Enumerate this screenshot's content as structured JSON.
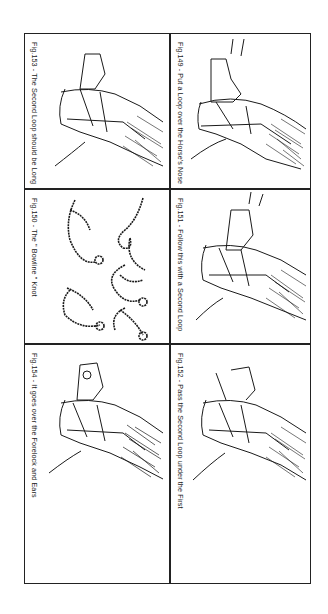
{
  "page": {
    "orientation": "rotated-90-clockwise",
    "layout": {
      "columns": 2,
      "rows": 3
    }
  },
  "panels": [
    {
      "id": "fig149",
      "column": "right",
      "row": 1,
      "caption": "Fig.149 - Put a Loop over the Horse's Nose",
      "illustration": "horse-head-loop-over-nose"
    },
    {
      "id": "fig151",
      "column": "right",
      "row": 2,
      "caption": "Fig.151 - Follow this with a Second Loop",
      "illustration": "horse-head-second-loop"
    },
    {
      "id": "fig152",
      "column": "right",
      "row": 3,
      "caption": "Fig.152 - Pass the Second Loop under the First",
      "illustration": "horse-head-pass-loop-under"
    },
    {
      "id": "fig153",
      "column": "left",
      "row": 1,
      "caption": "Fig.153 - The Second Loop should be Long",
      "illustration": "horse-head-long-loop"
    },
    {
      "id": "fig150",
      "column": "left",
      "row": 2,
      "caption": "Fig.150 - The \" Bowline \" Knot",
      "illustration": "bowline-knot-steps"
    },
    {
      "id": "fig154",
      "column": "left",
      "row": 3,
      "caption": "Fig.154 - It goes over the Forelock and Ears",
      "illustration": "horse-head-forelock-ears"
    }
  ],
  "colors": {
    "ink": "#1a1a1a",
    "paper": "#ffffff",
    "border": "#222222"
  }
}
